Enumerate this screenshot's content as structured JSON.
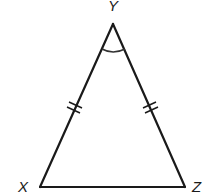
{
  "diagram": {
    "type": "isosceles-triangle",
    "vertices": [
      {
        "id": "Y",
        "label": "Y",
        "x": 113,
        "y": 24
      },
      {
        "id": "X",
        "label": "X",
        "x": 40,
        "y": 187
      },
      {
        "id": "Z",
        "label": "Z",
        "x": 185,
        "y": 187
      }
    ],
    "sides": [
      {
        "from": "X",
        "to": "Y",
        "tick_marks": 2
      },
      {
        "from": "Y",
        "to": "Z",
        "tick_marks": 2
      },
      {
        "from": "X",
        "to": "Z",
        "tick_marks": 0
      }
    ],
    "angle_marks": [
      {
        "vertex": "Y",
        "arcs": 1
      }
    ],
    "colors": {
      "stroke": "#1a1a1a",
      "background": "#ffffff"
    }
  }
}
